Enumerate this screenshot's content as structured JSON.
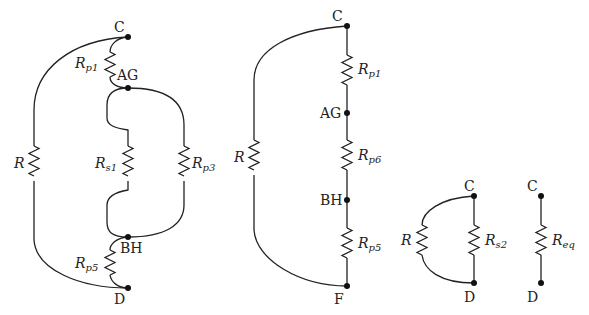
{
  "colors": {
    "wire": "#222222",
    "node": "#111111",
    "background": "#ffffff"
  },
  "diagram1": {
    "nodes": {
      "C": "C",
      "AG": "AG",
      "BH": "BH",
      "D": "D"
    },
    "resistors": {
      "R": {
        "base": "R",
        "sub": ""
      },
      "Rp1": {
        "base": "R",
        "sub": "p1"
      },
      "Rs1": {
        "base": "R",
        "sub": "s1"
      },
      "Rp3": {
        "base": "R",
        "sub": "p3"
      },
      "Rp5": {
        "base": "R",
        "sub": "p5"
      }
    }
  },
  "diagram2": {
    "nodes": {
      "C": "C",
      "AG": "AG",
      "BH": "BH",
      "F": "F"
    },
    "resistors": {
      "R": {
        "base": "R",
        "sub": ""
      },
      "Rp1": {
        "base": "R",
        "sub": "p1"
      },
      "Rp6": {
        "base": "R",
        "sub": "p6"
      },
      "Rp5": {
        "base": "R",
        "sub": "p5"
      }
    }
  },
  "diagram3": {
    "nodes": {
      "C": "C",
      "D": "D"
    },
    "resistors": {
      "R": {
        "base": "R",
        "sub": ""
      },
      "Rs2": {
        "base": "R",
        "sub": "s2"
      }
    }
  },
  "diagram4": {
    "nodes": {
      "C": "C",
      "D": "D"
    },
    "resistors": {
      "Req": {
        "base": "R",
        "sub": "eq"
      }
    }
  }
}
